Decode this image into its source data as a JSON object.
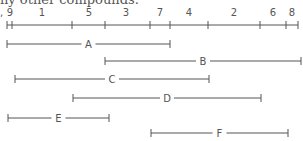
{
  "caption": "ny other compounds.",
  "axis": {
    "prefix": ",",
    "y": 25,
    "x_start": 7,
    "x_end": 298,
    "ticks": [
      7,
      12,
      72,
      105,
      150,
      170,
      208,
      260,
      286,
      298
    ],
    "labels": [
      {
        "text": "9",
        "x": 10
      },
      {
        "text": "1",
        "x": 42
      },
      {
        "text": "5",
        "x": 89
      },
      {
        "text": "3",
        "x": 126
      },
      {
        "text": "7",
        "x": 160
      },
      {
        "text": "4",
        "x": 189
      },
      {
        "text": "2",
        "x": 234
      },
      {
        "text": "6",
        "x": 273
      },
      {
        "text": "8",
        "x": 292
      }
    ]
  },
  "segments": [
    {
      "label": "A",
      "x1": 7,
      "x2": 170,
      "y": 44
    },
    {
      "label": "B",
      "x1": 105,
      "x2": 301,
      "y": 61
    },
    {
      "label": "C",
      "x1": 15,
      "x2": 209,
      "y": 79
    },
    {
      "label": "D",
      "x1": 73,
      "x2": 261,
      "y": 98
    },
    {
      "label": "E",
      "x1": 8,
      "x2": 109,
      "y": 118
    },
    {
      "label": "F",
      "x1": 151,
      "x2": 288,
      "y": 133
    }
  ],
  "colors": {
    "line": "#555555",
    "text": "#555555"
  }
}
